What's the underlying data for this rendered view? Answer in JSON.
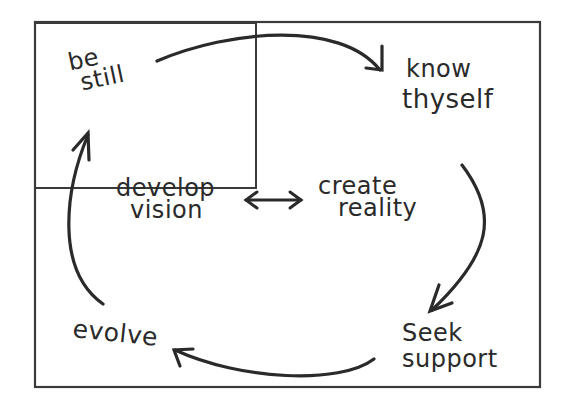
{
  "diagram": {
    "type": "cycle",
    "style": "hand-drawn",
    "stroke_color": "#2a2a2a",
    "background": "#ffffff",
    "nodes": [
      {
        "id": "be-still",
        "line1": "be",
        "line2": "still"
      },
      {
        "id": "know-thyself",
        "line1": "know",
        "line2": "thyself"
      },
      {
        "id": "seek-support",
        "line1": "Seek",
        "line2": "support"
      },
      {
        "id": "evolve",
        "line1": "evolve"
      }
    ],
    "center": {
      "left": {
        "line1": "develop",
        "line2": "vision"
      },
      "right": {
        "line1": "create",
        "line2": "reality"
      },
      "connector": "bidirectional-arrow"
    },
    "edges": [
      {
        "from": "be-still",
        "to": "know-thyself"
      },
      {
        "from": "know-thyself",
        "to": "seek-support"
      },
      {
        "from": "seek-support",
        "to": "evolve"
      },
      {
        "from": "evolve",
        "to": "be-still"
      }
    ]
  }
}
